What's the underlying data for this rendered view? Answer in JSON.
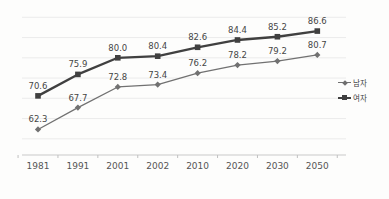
{
  "chart_data": {
    "type": "line",
    "title": "",
    "xlabel": "",
    "ylabel": "",
    "categories": [
      "1981",
      "1991",
      "2001",
      "2002",
      "2010",
      "2020",
      "2030",
      "2050"
    ],
    "series": [
      {
        "name": "남자",
        "values": [
          62.3,
          67.7,
          72.8,
          73.4,
          76.2,
          78.2,
          79.2,
          80.7
        ],
        "color": "#717171",
        "marker": "diamond",
        "line_width": 1.3
      },
      {
        "name": "여자",
        "values": [
          70.6,
          75.9,
          80.0,
          80.4,
          82.6,
          84.4,
          85.2,
          86.6
        ],
        "color": "#404040",
        "marker": "square",
        "line_width": 2.3
      }
    ],
    "ylim": [
      56,
      92
    ],
    "grid": true,
    "gridline_values": [
      60,
      65,
      70,
      75,
      80,
      85,
      90
    ],
    "data_labels": true,
    "data_label_decimals": 1,
    "legend_position": "right"
  },
  "colors": {
    "background": "#fdfdfc",
    "gridline": "#ececec",
    "axis_line": "#c9c9c9",
    "tick": "#c0c0c0",
    "data_label": "#454545",
    "axis_label": "#555555"
  }
}
